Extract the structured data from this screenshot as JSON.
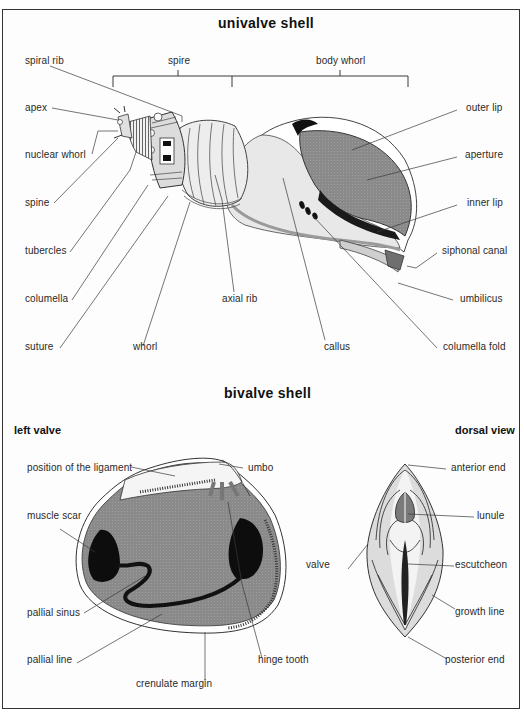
{
  "univalve": {
    "title": "univalve shell",
    "brackets": {
      "spire": "spire",
      "body_whorl": "body whorl"
    },
    "labels": {
      "spiral_rib": "spiral rib",
      "apex": "apex",
      "nuclear_whorl": "nuclear whorl",
      "spine": "spine",
      "tubercles": "tubercles",
      "columella": "columella",
      "suture": "suture",
      "whorl": "whorl",
      "axial_rib": "axial rib",
      "callus": "callus",
      "outer_lip": "outer lip",
      "aperture": "aperture",
      "inner_lip": "inner lip",
      "siphonal_canal": "siphonal canal",
      "umbilicus": "umbilicus",
      "columella_fold": "columella fold"
    }
  },
  "bivalve": {
    "title": "bivalve shell",
    "left_valve": {
      "title": "left valve",
      "labels": {
        "ligament": "position of the ligament",
        "umbo": "umbo",
        "muscle_scar": "muscle scar",
        "pallial_sinus": "pallial sinus",
        "pallial_line": "pallial line",
        "crenulate_margin": "crenulate margin",
        "hinge_tooth": "hinge tooth"
      }
    },
    "dorsal_view": {
      "title": "dorsal view",
      "labels": {
        "anterior_end": "anterior end",
        "lunule": "lunule",
        "valve": "valve",
        "escutcheon": "escutcheon",
        "growth_line": "growth line",
        "posterior_end": "posterior end"
      }
    }
  },
  "colors": {
    "frame": "#333333",
    "shell_light": "#e6e6e6",
    "shell_mid": "#bdbdbd",
    "aperture_fill": "#8c8c8c",
    "dark": "#111111",
    "leader_line": "#3a3a3a"
  }
}
